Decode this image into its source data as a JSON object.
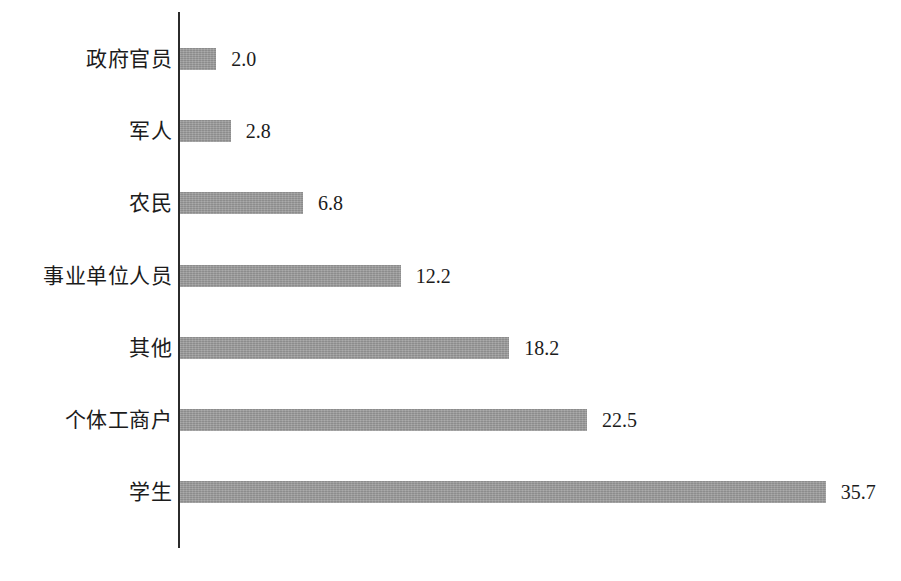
{
  "chart_data": {
    "type": "bar",
    "orientation": "horizontal",
    "title": "",
    "subtitle": "",
    "xlabel": "",
    "ylabel": "",
    "categories": [
      "政府官员",
      "军人",
      "农民",
      "事业单位人员",
      "其他",
      "个体工商户",
      "学生"
    ],
    "values": [
      2.0,
      2.8,
      6.8,
      12.2,
      18.2,
      22.5,
      35.7
    ],
    "value_labels": [
      "2.0",
      "2.8",
      "6.8",
      "12.2",
      "18.2",
      "22.5",
      "35.7"
    ],
    "xlim": [
      0,
      35.7
    ],
    "grid": false,
    "legend": false,
    "legend_position": "none",
    "data_labels": true,
    "data_label_position": "outside-end",
    "axis_visible": {
      "category_spine": true,
      "value_axis_ticks": false
    },
    "series": [
      {
        "name": "",
        "values": [
          2.0,
          2.8,
          6.8,
          12.2,
          18.2,
          22.5,
          35.7
        ]
      }
    ]
  },
  "style": {
    "bar_color": "#9a9a9a",
    "axis_color": "#2b2b2b",
    "text_color": "#1c1c1c",
    "background_color": "#ffffff"
  },
  "caption": {
    "text": ""
  }
}
